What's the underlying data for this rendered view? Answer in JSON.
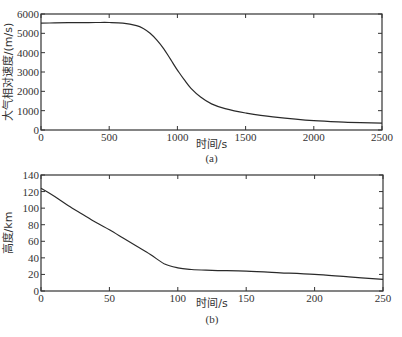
{
  "chart_data": [
    {
      "type": "line",
      "caption": "(a)",
      "title": "",
      "xlabel": "时间/s",
      "ylabel": "大气相对速度/(m/s)",
      "xlim": [
        0,
        2500
      ],
      "ylim": [
        0,
        6000
      ],
      "xticks": [
        0,
        500,
        1000,
        1500,
        2000,
        2500
      ],
      "yticks": [
        0,
        1000,
        2000,
        3000,
        4000,
        5000,
        6000
      ],
      "grid": false,
      "legend": null,
      "series": [
        {
          "name": "大气相对速度",
          "x": [
            0,
            100,
            200,
            300,
            400,
            500,
            600,
            700,
            750,
            800,
            850,
            900,
            950,
            1000,
            1050,
            1100,
            1170,
            1250,
            1350,
            1500,
            1700,
            2000,
            2250,
            2500
          ],
          "y": [
            5530,
            5540,
            5550,
            5555,
            5560,
            5560,
            5530,
            5400,
            5250,
            5000,
            4650,
            4200,
            3650,
            3100,
            2600,
            2150,
            1700,
            1350,
            1100,
            880,
            680,
            480,
            400,
            350
          ]
        }
      ]
    },
    {
      "type": "line",
      "caption": "(b)",
      "title": "",
      "xlabel": "时间/s",
      "ylabel": "高度/km",
      "xlim": [
        0,
        250
      ],
      "ylim": [
        0,
        140
      ],
      "xticks": [
        0,
        50,
        100,
        150,
        200,
        250
      ],
      "yticks": [
        0,
        20,
        40,
        60,
        80,
        100,
        120,
        140
      ],
      "grid": false,
      "legend": null,
      "series": [
        {
          "name": "高度",
          "x": [
            0,
            10,
            20,
            30,
            40,
            50,
            60,
            70,
            80,
            90,
            100,
            110,
            125,
            150,
            175,
            200,
            225,
            250
          ],
          "y": [
            124,
            114,
            103,
            93,
            83,
            74,
            64,
            54,
            44,
            33,
            28,
            26,
            25,
            24,
            22,
            20,
            17,
            14
          ]
        }
      ]
    }
  ]
}
